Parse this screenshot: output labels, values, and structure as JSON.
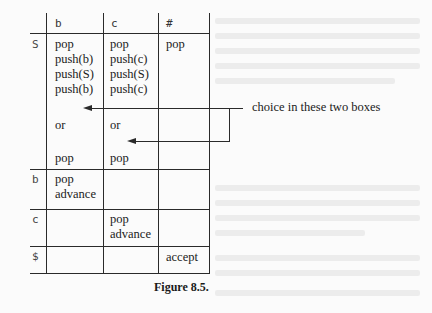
{
  "table": {
    "column_headers": [
      "b",
      "c",
      "#"
    ],
    "row_headers": [
      "S",
      "b",
      "c",
      "$"
    ],
    "cells": {
      "S_b": [
        "pop",
        "push(b)",
        "push(S)",
        "push(b)"
      ],
      "S_c": [
        "pop",
        "push(c)",
        "push(S)",
        "push(c)"
      ],
      "S_hash": [
        "pop"
      ],
      "S_b_or": "or",
      "S_c_or": "or",
      "S_b_alt": "pop",
      "S_c_alt": "pop",
      "b_b": [
        "pop",
        "advance"
      ],
      "c_c": [
        "pop",
        "advance"
      ],
      "dollar_hash": "accept"
    }
  },
  "annotation": {
    "text": "choice in these two boxes",
    "arrow_targets": [
      "S_b after push sequence",
      "S_c after or"
    ]
  },
  "caption": "Figure 8.5."
}
